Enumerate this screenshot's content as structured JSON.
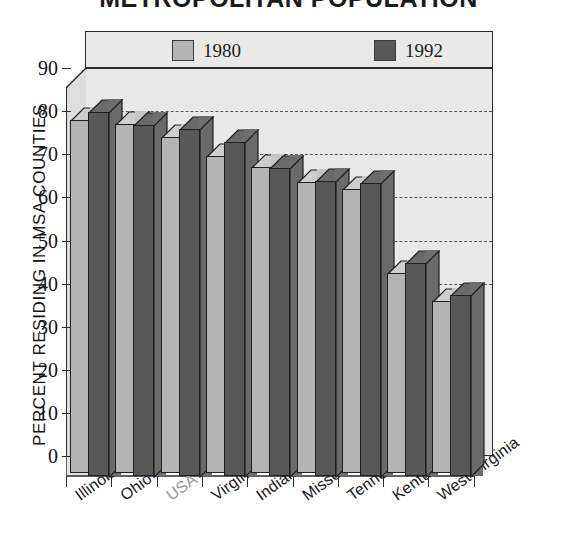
{
  "chart_data": {
    "type": "bar",
    "title": "METROPOLITAN POPULATION",
    "xlabel": "",
    "ylabel": "PERCENT RESIDING IN MSA COUNTIES",
    "ylim": [
      0,
      95
    ],
    "yticks": [
      0,
      10,
      20,
      30,
      40,
      50,
      60,
      70,
      80,
      90
    ],
    "grid": true,
    "legend_position": "top",
    "categories": [
      "Illinois",
      "Ohio",
      "USA",
      "Virginia",
      "Indiana",
      "Missouri",
      "Tennessee",
      "Kentucky",
      "West Virginia"
    ],
    "series": [
      {
        "name": "1980",
        "color": "#b4b4b2",
        "values": [
          82,
          81,
          78,
          73.5,
          71,
          67.5,
          66,
          46.5,
          40
        ]
      },
      {
        "name": "1992",
        "color": "#585856",
        "values": [
          84.5,
          81.5,
          80.5,
          77.5,
          71.5,
          68.5,
          68,
          49.5,
          42
        ]
      }
    ]
  },
  "legend": {
    "entries": [
      {
        "label": "1980",
        "swatch": "#b4b4b2"
      },
      {
        "label": "1992",
        "swatch": "#585856"
      }
    ]
  },
  "axes": {
    "y_title": "PERCENT RESIDING IN MSA COUNTIES",
    "y_ticks": [
      "90",
      "80",
      "70",
      "60",
      "50",
      "40",
      "30",
      "20",
      "10",
      "0"
    ],
    "x_labels": [
      "Illinois",
      "Ohio",
      "USA",
      "Virginia",
      "Indiana",
      "Missouri",
      "Tennessee",
      "Kentucky",
      "West Virginia"
    ],
    "x_label_muted_index": 2
  },
  "colors": {
    "plot_background": "#e9e9e7",
    "axis_line": "#2a2a2a",
    "gridline": "#5a5a5a",
    "text": "#141414",
    "muted_text": "#9a9a9a"
  }
}
